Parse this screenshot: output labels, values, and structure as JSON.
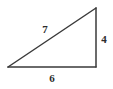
{
  "figure": {
    "kind": "right-triangle",
    "background_color": "#ffffff",
    "stroke_color": "#3a3a3a",
    "stroke_width": 1.5,
    "label_color": "#2b2b2b",
    "vertices": {
      "left": {
        "x": 8,
        "y": 67
      },
      "top_right": {
        "x": 96,
        "y": 8
      },
      "bottom_right": {
        "x": 96,
        "y": 67
      }
    },
    "right_angle_marker": false,
    "sides": [
      {
        "name": "hypotenuse",
        "label": "7",
        "from": "left",
        "to": "top_right",
        "label_position": {
          "x": 45,
          "y": 29
        }
      },
      {
        "name": "vertical-leg",
        "label": "4",
        "from": "top_right",
        "to": "bottom_right",
        "label_position": {
          "x": 104,
          "y": 39
        }
      },
      {
        "name": "base-leg",
        "label": "6",
        "from": "left",
        "to": "bottom_right",
        "label_position": {
          "x": 52,
          "y": 78
        }
      }
    ]
  }
}
